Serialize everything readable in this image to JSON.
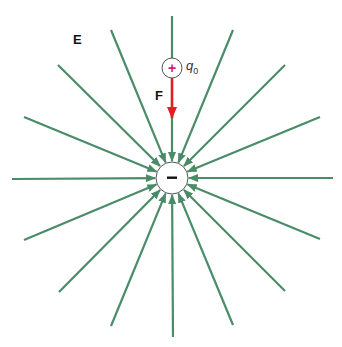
{
  "diagram": {
    "labels": {
      "field": "E",
      "force": "F",
      "test_charge": "q",
      "test_charge_subscript": "0",
      "negative_charge_sign": "−",
      "positive_charge_sign": "+"
    },
    "colors": {
      "field_lines": "#4a8c68",
      "force_arrow": "#e02020",
      "positive_sign": "#d0206a",
      "charge_outline": "#555555",
      "negative_sign": "#111111"
    },
    "negative_charge": {
      "cx": 172,
      "cy": 178,
      "r": 16
    },
    "test_charge_position": {
      "cx": 172,
      "cy": 68,
      "r": 10
    },
    "field_line_count": 16,
    "field_line_starts": [
      [
        172,
        16
      ],
      [
        233,
        30
      ],
      [
        285,
        65
      ],
      [
        320,
        117
      ],
      [
        333,
        178
      ],
      [
        320,
        239
      ],
      [
        285,
        291
      ],
      [
        233,
        325
      ],
      [
        173,
        337
      ],
      [
        111,
        326
      ],
      [
        59,
        292
      ],
      [
        24,
        240
      ],
      [
        12,
        179
      ],
      [
        24,
        117
      ],
      [
        58,
        65
      ],
      [
        111,
        30
      ]
    ]
  }
}
